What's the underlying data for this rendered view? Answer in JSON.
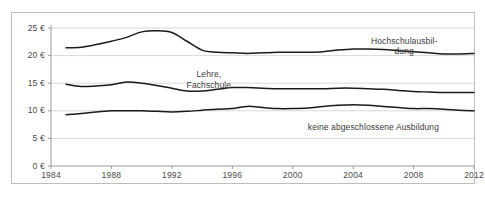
{
  "figure": {
    "title_remnant": "",
    "background_color": "#ffffff",
    "border_color": "#bdbdbd",
    "line_color": "#1a1a1a",
    "grid_color": "#d9d9d9",
    "axis_color": "#9a9a9a",
    "tick_text_color": "#4a4a4a"
  },
  "annotations": [
    {
      "id": "hochschulausbildung",
      "line1": "Hochschulausbil-",
      "line2": "dung"
    },
    {
      "id": "lehre-fachschule",
      "line1": "Lehre,",
      "line2": "Fachschule"
    },
    {
      "id": "keine-ausbildung",
      "line1": "keine abgeschlossene Ausbildung",
      "line2": ""
    }
  ],
  "chart_data": {
    "type": "line",
    "title": "",
    "subtitle": "",
    "xlabel": "",
    "ylabel": "",
    "xlim": [
      1984,
      2012
    ],
    "ylim": [
      0,
      25
    ],
    "grid": true,
    "grid_axis": "y",
    "legend_position": "inline-annotations",
    "y_ticks": [
      0,
      5,
      10,
      15,
      20,
      25
    ],
    "y_tick_labels": [
      "0 €",
      "5 €",
      "10 €",
      "15 €",
      "20 €",
      "25 €"
    ],
    "x_ticks": [
      1984,
      1988,
      1992,
      1996,
      2000,
      2004,
      2008,
      2012
    ],
    "x_tick_labels": [
      "1984",
      "1988",
      "1992",
      "1996",
      "2000",
      "2004",
      "2008",
      "2012"
    ],
    "x": [
      1985,
      1986,
      1987,
      1988,
      1989,
      1990,
      1991,
      1992,
      1993,
      1994,
      1995,
      1996,
      1997,
      1998,
      1999,
      2000,
      2001,
      2002,
      2003,
      2004,
      2005,
      2006,
      2007,
      2008,
      2009,
      2010,
      2011,
      2012
    ],
    "series": [
      {
        "name": "Hochschulausbildung",
        "label_line1": "Hochschulausbil-",
        "label_line2": "dung",
        "color": "#1a1a1a",
        "values": [
          21.4,
          21.5,
          22.0,
          22.6,
          23.3,
          24.3,
          24.5,
          24.2,
          22.6,
          21.0,
          20.6,
          20.5,
          20.4,
          20.5,
          20.6,
          20.6,
          20.6,
          20.7,
          21.0,
          21.2,
          21.2,
          21.1,
          20.9,
          20.7,
          20.5,
          20.3,
          20.3,
          20.4
        ]
      },
      {
        "name": "Lehre, Fachschule",
        "label_line1": "Lehre,",
        "label_line2": "Fachschule",
        "color": "#1a1a1a",
        "values": [
          14.8,
          14.4,
          14.5,
          14.7,
          15.2,
          15.0,
          14.6,
          14.1,
          13.6,
          13.6,
          13.9,
          14.2,
          14.2,
          14.1,
          14.0,
          14.0,
          14.0,
          14.0,
          14.1,
          14.1,
          14.0,
          13.9,
          13.7,
          13.5,
          13.4,
          13.3,
          13.3,
          13.3
        ]
      },
      {
        "name": "keine abgeschlossene Ausbildung",
        "label_line1": "keine abgeschlossene Ausbildung",
        "label_line2": "",
        "color": "#1a1a1a",
        "values": [
          9.3,
          9.5,
          9.8,
          10.0,
          10.0,
          10.0,
          9.9,
          9.8,
          9.9,
          10.1,
          10.3,
          10.4,
          10.8,
          10.6,
          10.4,
          10.4,
          10.5,
          10.8,
          11.0,
          11.1,
          11.0,
          10.8,
          10.6,
          10.4,
          10.4,
          10.3,
          10.1,
          10.0
        ]
      }
    ]
  }
}
